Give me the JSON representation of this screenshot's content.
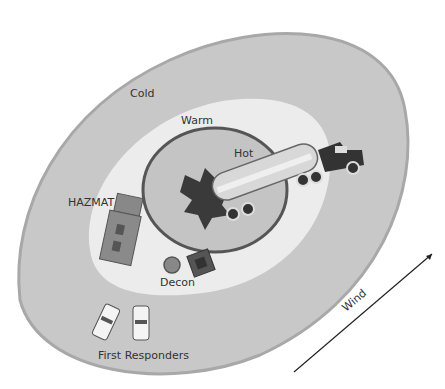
{
  "diagram": {
    "zones": [
      {
        "id": "cold",
        "label": "Cold",
        "color": "#c8c8c8"
      },
      {
        "id": "warm",
        "label": "Warm",
        "color": "#ececec"
      },
      {
        "id": "hot",
        "label": "Hot",
        "color": "#c4c4c4"
      }
    ],
    "labels": {
      "cold": "Cold",
      "warm": "Warm",
      "hot": "Hot",
      "hazmat": "HAZMAT",
      "decon": "Decon",
      "first_responders": "First Responders",
      "wind": "Wind"
    }
  }
}
